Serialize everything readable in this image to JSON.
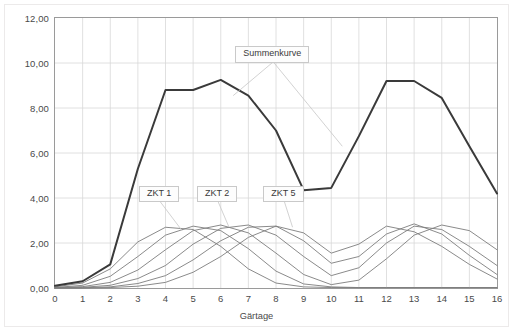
{
  "chart_data": {
    "type": "line",
    "title": "",
    "xlabel": "Gärtage",
    "ylabel": "Extraktabbau als vEs/(d ·100 kg)",
    "xlim": [
      0,
      16
    ],
    "ylim": [
      0,
      12
    ],
    "grid": true,
    "legend_position": "inline-callouts",
    "x_ticks": [
      0,
      1,
      2,
      3,
      4,
      5,
      6,
      7,
      8,
      9,
      10,
      11,
      12,
      13,
      14,
      15,
      16
    ],
    "x_tick_labels": [
      "0",
      "1",
      "2",
      "3",
      "4",
      "5",
      "6",
      "7",
      "8",
      "9",
      "10",
      "11",
      "12",
      "13",
      "14",
      "15",
      "16"
    ],
    "y_ticks": [
      0,
      2,
      4,
      6,
      8,
      10,
      12
    ],
    "y_tick_labels": [
      "0,00",
      "2,00",
      "4,00",
      "6,00",
      "8,00",
      "10,00",
      "12,00"
    ],
    "x": [
      0,
      1,
      2,
      3,
      4,
      5,
      6,
      7,
      8,
      9,
      10,
      11,
      12,
      13,
      14,
      15,
      16
    ],
    "series": [
      {
        "name": "Summenkurve",
        "color": "#3a3a3a",
        "width": 2.0,
        "values": [
          0.1,
          0.3,
          1.05,
          5.3,
          8.8,
          8.8,
          9.25,
          8.55,
          7.0,
          4.35,
          4.45,
          6.75,
          9.2,
          9.2,
          8.45,
          6.3,
          4.2
        ]
      },
      {
        "name": "ZKT 1",
        "color": "#7d7d7d",
        "width": 0.9,
        "values": [
          0.05,
          0.22,
          0.85,
          2.05,
          2.7,
          2.6,
          1.85,
          0.85,
          0.22,
          0.05,
          0.02,
          0.02,
          0.02,
          0.02,
          0.02,
          0.02,
          0.02
        ]
      },
      {
        "name": "ZKT 2",
        "color": "#7d7d7d",
        "width": 0.9,
        "values": [
          0.02,
          0.12,
          0.52,
          1.4,
          2.35,
          2.75,
          2.55,
          1.75,
          0.75,
          0.18,
          0.05,
          0.02,
          0.02,
          0.02,
          0.02,
          0.02,
          0.02
        ]
      },
      {
        "name": "ZKT 3",
        "color": "#7d7d7d",
        "width": 0.9,
        "values": [
          0.02,
          0.06,
          0.25,
          0.8,
          1.7,
          2.55,
          2.8,
          2.45,
          1.55,
          0.6,
          0.15,
          0.35,
          1.3,
          2.35,
          2.8,
          2.55,
          1.7
        ]
      },
      {
        "name": "ZKT 4",
        "color": "#7d7d7d",
        "width": 0.9,
        "values": [
          0.01,
          0.03,
          0.12,
          0.42,
          1.0,
          1.95,
          2.65,
          2.8,
          2.35,
          1.4,
          0.55,
          0.9,
          2.0,
          2.75,
          2.6,
          1.85,
          1.0
        ]
      },
      {
        "name": "ZKT 5",
        "color": "#7d7d7d",
        "width": 0.9,
        "values": [
          0.0,
          0.01,
          0.05,
          0.2,
          0.55,
          1.25,
          2.1,
          2.7,
          2.75,
          2.1,
          1.1,
          1.4,
          2.4,
          2.85,
          2.4,
          1.45,
          0.6
        ]
      },
      {
        "name": "ZKT 6",
        "color": "#7d7d7d",
        "width": 0.9,
        "values": [
          0.0,
          0.0,
          0.02,
          0.08,
          0.25,
          0.7,
          1.4,
          2.25,
          2.75,
          2.45,
          1.55,
          1.95,
          2.75,
          2.5,
          1.85,
          1.05,
          0.4
        ]
      }
    ],
    "annotations": [
      {
        "text": "Summenkurve",
        "x": 7.9,
        "y": 10.35
      },
      {
        "text": "ZKT 1",
        "x": 3.8,
        "y": 4.15
      },
      {
        "text": "ZKT 2",
        "x": 5.9,
        "y": 4.15
      },
      {
        "text": "ZKT 5",
        "x": 8.3,
        "y": 4.15
      }
    ]
  },
  "callouts": {
    "summenkurve": "Summenkurve",
    "zkt1": "ZKT 1",
    "zkt2": "ZKT 2",
    "zkt5": "ZKT 5"
  },
  "axes": {
    "x_title": "Gärtage",
    "y_title": "Extraktabbau als vEs/(d ·100 kg)"
  }
}
